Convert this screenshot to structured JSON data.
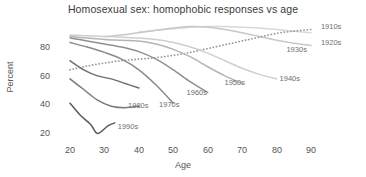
{
  "chart_data": {
    "type": "line",
    "title": "Homosexual sex: homophobic responses vs age",
    "xlabel": "Age",
    "ylabel": "Percent",
    "xlim": [
      15,
      95
    ],
    "ylim": [
      14,
      94
    ],
    "xticks": [
      20,
      30,
      40,
      50,
      60,
      70,
      80,
      90
    ],
    "yticks": [
      20,
      40,
      60,
      80
    ],
    "grid": false,
    "legend_position": "inline-right-of-line",
    "series": [
      {
        "name": "1910s",
        "color": "#d8d8d8",
        "style": "solid",
        "label_x": 92,
        "label_y": 90,
        "x": [
          40,
          45,
          50,
          55,
          60,
          65,
          70,
          75,
          80,
          85,
          90
        ],
        "values": [
          87,
          88,
          89,
          90,
          90.5,
          90.5,
          90,
          89.5,
          88.5,
          87.5,
          86.5
        ]
      },
      {
        "name": "1920s",
        "color": "#c8c8c8",
        "style": "solid",
        "label_x": 92,
        "label_y": 80,
        "x": [
          30,
          35,
          40,
          45,
          50,
          55,
          60,
          65,
          70,
          75,
          80,
          85,
          90
        ],
        "values": [
          84,
          85,
          86.5,
          88,
          89.5,
          90.5,
          90,
          88.5,
          86.5,
          84,
          81.5,
          79.5,
          78
        ]
      },
      {
        "name": "1930s",
        "color": "#9a9a9a",
        "style": "dotted",
        "label_x": 82,
        "label_y": 75,
        "x": [
          20,
          25,
          30,
          35,
          40,
          45,
          50,
          55,
          60,
          65,
          70,
          75,
          80,
          85,
          90
        ],
        "values": [
          62,
          64.5,
          66.5,
          68,
          69,
          70,
          71.5,
          73.5,
          76,
          78.5,
          81,
          83.5,
          86,
          87.5,
          88.5
        ]
      },
      {
        "name": "1940s",
        "color": "#cfcfcf",
        "style": "solid",
        "label_x": 80,
        "label_y": 56,
        "x": [
          20,
          25,
          30,
          35,
          40,
          45,
          50,
          55,
          60,
          65,
          70,
          75,
          80
        ],
        "values": [
          85,
          84.5,
          84,
          83.5,
          83,
          82,
          80,
          77,
          73,
          68,
          63,
          59,
          56
        ]
      },
      {
        "name": "1950s",
        "color": "#b5b5b5",
        "style": "solid",
        "label_x": 64,
        "label_y": 53,
        "x": [
          20,
          25,
          30,
          35,
          40,
          45,
          50,
          55,
          60,
          65,
          70
        ],
        "values": [
          84,
          83,
          82,
          81.5,
          81,
          79,
          75.5,
          70.5,
          64,
          58,
          53
        ]
      },
      {
        "name": "1960s",
        "color": "#8f8f8f",
        "style": "solid",
        "label_x": 53,
        "label_y": 47,
        "x": [
          20,
          25,
          30,
          35,
          40,
          45,
          50,
          55,
          60
        ],
        "values": [
          83,
          81,
          79,
          77,
          74,
          69,
          62,
          54,
          47
        ]
      },
      {
        "name": "1970s",
        "color": "#8a8a8a",
        "style": "solid",
        "label_x": 45,
        "label_y": 39,
        "x": [
          20,
          25,
          30,
          35,
          40,
          45,
          50
        ],
        "values": [
          80,
          77,
          73.5,
          69,
          62,
          52,
          40
        ]
      },
      {
        "name": "1980s",
        "color": "#6f6f6f",
        "style": "solid",
        "label_x": 36,
        "label_y": 38,
        "x": [
          20,
          24,
          28,
          32,
          36,
          40
        ],
        "values": [
          68,
          62,
          58,
          56,
          53,
          50
        ]
      },
      {
        "name": "1990s",
        "color": "#5a5a5a",
        "style": "solid",
        "label_x": 33,
        "label_y": 24,
        "x": [
          20,
          23,
          26,
          28,
          31,
          33
        ],
        "values": [
          40,
          32,
          26,
          20,
          25,
          27
        ]
      },
      {
        "name": "1980s-lower",
        "color": "#7a7a7a",
        "style": "solid",
        "label_x": null,
        "label_y": null,
        "x": [
          20,
          24,
          28,
          32,
          36,
          40
        ],
        "values": [
          56,
          49,
          42,
          38,
          37,
          38
        ]
      }
    ]
  },
  "labels": {
    "ytick_values": [
      "80",
      "60",
      "40",
      "20"
    ],
    "xtick_values": [
      "20",
      "30",
      "40",
      "50",
      "60",
      "70",
      "80",
      "90"
    ]
  }
}
